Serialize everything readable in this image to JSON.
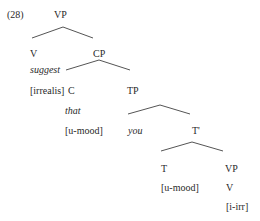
{
  "example_number": "(28)",
  "tree": {
    "root": "VP",
    "v": {
      "label": "V",
      "word": "suggest",
      "feature": "[irrealis]"
    },
    "cp": {
      "label": "CP"
    },
    "c": {
      "label": "C",
      "word": "that",
      "feature": "[u-mood]"
    },
    "tp": {
      "label": "TP"
    },
    "subject": {
      "word": "you"
    },
    "tbar": {
      "label": "T'"
    },
    "t": {
      "label": "T",
      "feature": "[u-mood]"
    },
    "vp2": {
      "label": "VP",
      "v": "V",
      "feature": "[i-irr]"
    }
  }
}
